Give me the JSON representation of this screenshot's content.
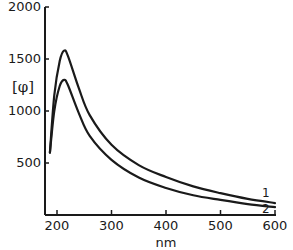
{
  "chart_data": {
    "type": "line",
    "title": "",
    "xlabel": "nm",
    "ylabel": "[φ]",
    "xlim": [
      178,
      600
    ],
    "ylim": [
      0,
      2000
    ],
    "x_ticks": [
      200,
      300,
      400,
      500,
      600
    ],
    "y_ticks": [
      500,
      1000,
      1500,
      2000
    ],
    "grid": false,
    "legend_position": "inline-right",
    "series": [
      {
        "name": "1",
        "x": [
          187,
          195,
          205,
          213,
          220,
          240,
          260,
          300,
          350,
          400,
          450,
          500,
          550,
          600
        ],
        "values": [
          600,
          1150,
          1480,
          1580,
          1530,
          1220,
          960,
          675,
          480,
          365,
          275,
          210,
          155,
          115
        ]
      },
      {
        "name": "2",
        "x": [
          187,
          195,
          205,
          213,
          220,
          240,
          260,
          300,
          350,
          400,
          450,
          500,
          550,
          600
        ],
        "values": [
          600,
          1000,
          1240,
          1300,
          1250,
          980,
          760,
          530,
          360,
          260,
          190,
          145,
          105,
          75
        ]
      }
    ]
  },
  "labels": {
    "xlabel": "nm",
    "ylabel": "[φ]",
    "x_ticks": [
      "200",
      "300",
      "400",
      "500",
      "600"
    ],
    "y_ticks": [
      "500",
      "1000",
      "1500",
      "2000"
    ],
    "series_1": "1",
    "series_2": "2"
  },
  "colors": {
    "line": "#1a1a1a",
    "background": "#ffffff"
  }
}
